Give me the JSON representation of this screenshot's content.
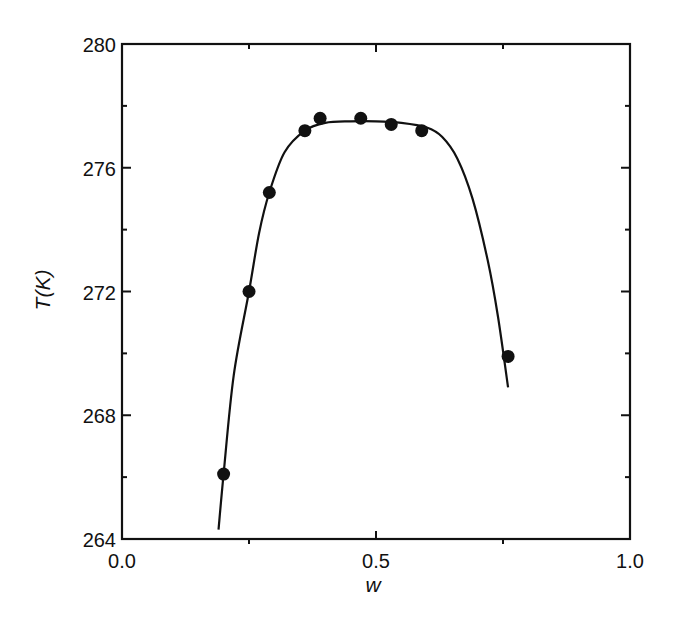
{
  "chart_data": {
    "type": "scatter",
    "title": "",
    "xlabel": "w",
    "ylabel": "T(K)",
    "xlim": [
      0.0,
      1.0
    ],
    "ylim": [
      264,
      280
    ],
    "x_ticks": [
      0.0,
      0.5,
      1.0
    ],
    "x_tick_labels": [
      "0.0",
      "0.5",
      "1.0"
    ],
    "x_minor_ticks": [
      0.25,
      0.75
    ],
    "y_ticks": [
      264,
      268,
      272,
      276,
      280
    ],
    "y_tick_labels": [
      "264",
      "268",
      "272",
      "276",
      "280"
    ],
    "y_minor_ticks": [
      266,
      270,
      274,
      278
    ],
    "grid": false,
    "legend": null,
    "series": [
      {
        "name": "measured",
        "kind": "scatter",
        "marker": "filled-circle",
        "color": "#111111",
        "x": [
          0.2,
          0.25,
          0.29,
          0.36,
          0.39,
          0.47,
          0.53,
          0.59,
          0.76
        ],
        "y": [
          266.1,
          272.0,
          275.2,
          277.2,
          277.6,
          277.6,
          277.4,
          277.2,
          269.9
        ]
      },
      {
        "name": "fit",
        "kind": "line",
        "color": "#111111",
        "x": [
          0.19,
          0.2,
          0.22,
          0.25,
          0.27,
          0.29,
          0.32,
          0.36,
          0.4,
          0.45,
          0.5,
          0.55,
          0.6,
          0.63,
          0.66,
          0.69,
          0.72,
          0.74,
          0.76
        ],
        "y": [
          264.3,
          266.1,
          269.3,
          272.0,
          273.9,
          275.2,
          276.5,
          277.2,
          277.45,
          277.5,
          277.5,
          277.45,
          277.3,
          277.0,
          276.3,
          275.0,
          273.0,
          271.2,
          268.9
        ]
      }
    ]
  }
}
